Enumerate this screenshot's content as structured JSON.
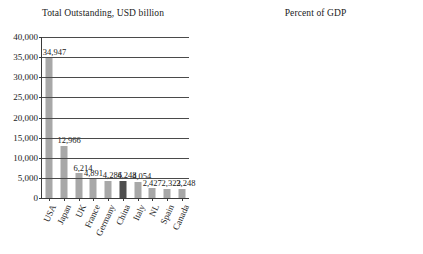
{
  "chart_data": [
    {
      "type": "bar",
      "title": "Total Outstanding, USD billion",
      "xlabel": "",
      "ylabel": "",
      "ylim": [
        0,
        40000
      ],
      "ytick_values": [
        0,
        5000,
        10000,
        15000,
        20000,
        25000,
        30000,
        35000,
        40000
      ],
      "ytick_labels": [
        "0",
        "5,000",
        "10,000",
        "15,000",
        "20,000",
        "25,000",
        "30,000",
        "35,000",
        "40,000"
      ],
      "grid": true,
      "legend": "none",
      "categories": [
        "USA",
        "Japan",
        "UK",
        "France",
        "Germany",
        "China",
        "Italy",
        "NL",
        "Spain",
        "Canada"
      ],
      "values": [
        34947,
        12966,
        6214,
        4891,
        4286,
        4248,
        4054,
        2427,
        2323,
        2248
      ],
      "value_labels": [
        "34,947",
        "12,966",
        "6,214",
        "4,891",
        "4,286",
        "4,248",
        "4,054",
        "2,427",
        "2,323",
        "2,248"
      ],
      "highlight_category": "China",
      "colors": {
        "bar": "#a8a8a8",
        "highlight": "#4f4f4f"
      }
    },
    {
      "type": "bar",
      "title": "Percent of GDP",
      "xlabel": "",
      "ylabel": "",
      "ylim": [
        0,
        300
      ],
      "ytick_values": [
        0,
        50,
        100,
        150,
        200,
        250,
        300
      ],
      "ytick_labels": [
        "0",
        "50",
        "100",
        "150",
        "200",
        "250",
        "300"
      ],
      "grid": true,
      "legend": "none",
      "categories": [
        "NL",
        "Japan",
        "UK",
        "USA",
        "Italy",
        "France",
        "Spain",
        "Canada",
        "Germany",
        "China"
      ],
      "values": [
        276,
        272,
        207,
        197,
        189,
        178,
        168,
        125,
        112,
        41
      ],
      "value_labels": [
        "276",
        "272",
        "207",
        "197",
        "189",
        "178",
        "168",
        "125",
        "112",
        "41"
      ],
      "highlight_category": "China",
      "colors": {
        "bar": "#a8a8a8",
        "highlight": "#4f4f4f"
      }
    }
  ]
}
